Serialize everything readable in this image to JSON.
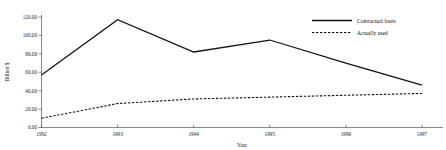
{
  "chart_data": {
    "type": "line",
    "title": "",
    "xlabel": "Year",
    "ylabel": "Billion $",
    "categories": [
      "1992",
      "1993",
      "1994",
      "1995",
      "1996",
      "1997"
    ],
    "x": [
      1992,
      1993,
      1994,
      1995,
      1996,
      1997
    ],
    "xlim": [
      1992,
      1997
    ],
    "ylim": [
      0,
      120
    ],
    "ytick_labels": [
      "0.00",
      "20.00",
      "40.00",
      "60.00",
      "80.00",
      "100.00",
      "120.00"
    ],
    "ytick_values": [
      0,
      20,
      40,
      60,
      80,
      100,
      120
    ],
    "xtick_labels": [
      "1992",
      "1993",
      "1994",
      "1995",
      "1996",
      "1997"
    ],
    "grid": false,
    "legend_position": "top-right",
    "series": [
      {
        "name": "Contractual basis",
        "style": "solid",
        "color": "#111111",
        "values": [
          57,
          117,
          82,
          95,
          70,
          46
        ]
      },
      {
        "name": "Actually used",
        "style": "dashed",
        "color": "#111111",
        "values": [
          10,
          26,
          31,
          33,
          35,
          37
        ]
      }
    ]
  },
  "legend": {
    "items": [
      {
        "label": "Contractual basis",
        "style": "solid"
      },
      {
        "label": "Actually used",
        "style": "dashed"
      }
    ]
  },
  "axes": {
    "y_title": "Billion $",
    "x_title": "Year"
  }
}
